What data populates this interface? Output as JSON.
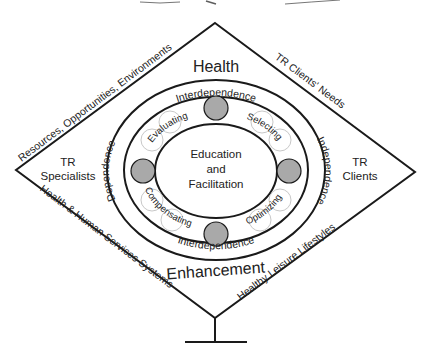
{
  "diagram": {
    "type": "leisure-ability-model",
    "center": {
      "lines": [
        "Education",
        "and",
        "Facilitation"
      ]
    },
    "ring_top": "Health",
    "ring_bottom": "Enhancement",
    "band_labels": {
      "top": "Interdependence",
      "bottom": "Interdependence",
      "left": "Dependence",
      "right": "Independence"
    },
    "process_labels": {
      "upper_left": "Evaluating",
      "upper_right": "Selecting",
      "lower_left": "Compensating",
      "lower_right": "Optimizing"
    },
    "diamond_edges": {
      "upper_left": "Resources, Opportunities, Environments",
      "upper_right": "TR Clients' Needs",
      "lower_left": "Health & Human Services Systems",
      "lower_right": "Healthy Leisure Lifestyles"
    },
    "side_labels": {
      "left": [
        "TR",
        "Specialists"
      ],
      "right": [
        "TR",
        "Clients"
      ]
    },
    "colors": {
      "line": "#1a1a1a",
      "node_fill": "#a9a9a9",
      "label_circle": "#c8c8c8",
      "background": "#ffffff"
    }
  }
}
